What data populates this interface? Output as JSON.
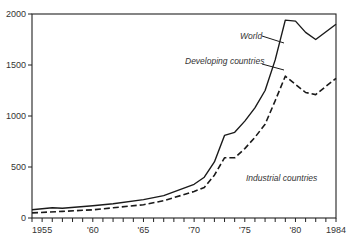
{
  "chart_data": {
    "type": "line",
    "title": "",
    "xlabel": "",
    "ylabel": "",
    "xlim": [
      1954,
      1984
    ],
    "ylim": [
      0,
      2000
    ],
    "grid": false,
    "legend": "inline annotations",
    "y_ticks": [
      0,
      500,
      1000,
      1500,
      2000
    ],
    "y_tick_labels": [
      "0",
      "500",
      "1000",
      "1500",
      "2000"
    ],
    "x_ticks": [
      1955,
      1960,
      1965,
      1970,
      1975,
      1980,
      1984
    ],
    "x_tick_labels": [
      "1955",
      "'60",
      "'65",
      "'70",
      "'75",
      "'80",
      "1984"
    ],
    "annotations": [
      {
        "text": "World",
        "series": "World"
      },
      {
        "text": "Developing countries",
        "series": "Developing countries"
      },
      {
        "text": "Industrial countries",
        "series": "Industrial countries"
      }
    ],
    "series": [
      {
        "name": "World",
        "style": "solid",
        "x": [
          1954,
          1956,
          1957,
          1960,
          1962,
          1965,
          1967,
          1970,
          1971,
          1972,
          1973,
          1974,
          1975,
          1976,
          1977,
          1978,
          1979,
          1980,
          1981,
          1982,
          1984
        ],
        "values": [
          80,
          100,
          95,
          120,
          140,
          180,
          220,
          330,
          400,
          550,
          810,
          840,
          950,
          1080,
          1250,
          1550,
          1940,
          1930,
          1820,
          1750,
          1900
        ]
      },
      {
        "name": "Industrial countries",
        "style": "dashed",
        "x": [
          1954,
          1957,
          1960,
          1962,
          1965,
          1967,
          1970,
          1971,
          1972,
          1973,
          1974,
          1975,
          1976,
          1977,
          1978,
          1979,
          1980,
          1981,
          1982,
          1984
        ],
        "values": [
          50,
          65,
          80,
          100,
          130,
          170,
          260,
          300,
          420,
          590,
          590,
          680,
          790,
          920,
          1150,
          1390,
          1310,
          1230,
          1210,
          1370
        ]
      }
    ]
  },
  "colors": {
    "line": "#1a1a1a",
    "axis": "#222222",
    "text": "#333333"
  }
}
